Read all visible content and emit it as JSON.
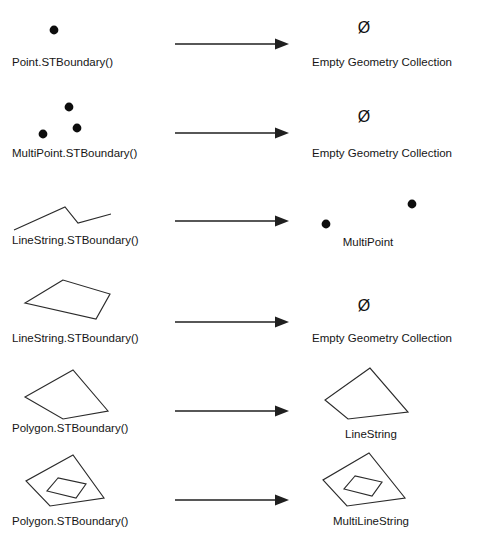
{
  "figure": {
    "background_color": "#ffffff",
    "stroke_color": "#2b2b2b",
    "arrow_color": "#1f1f1f",
    "dot_color": "#0d0d0d",
    "empty_symbol": "Ø",
    "footer_note": ""
  },
  "rows": [
    {
      "id": "point",
      "input_label": "Point.STBoundary()",
      "input_type": "point",
      "output_label": "Empty Geometry Collection",
      "output_type": "empty",
      "output_symbol": "Ø",
      "arrow": "→"
    },
    {
      "id": "multipoint",
      "input_label": "MultiPoint.STBoundary()",
      "input_type": "multipoint",
      "output_label": "Empty Geometry Collection",
      "output_type": "empty",
      "output_symbol": "Ø",
      "arrow": "→"
    },
    {
      "id": "linestring-open",
      "input_label": "LineString.STBoundary()",
      "input_type": "open-linestring",
      "output_label": "MultiPoint",
      "output_type": "multipoint",
      "output_symbol": "",
      "arrow": "→"
    },
    {
      "id": "linestring-closed",
      "input_label": "LineString.STBoundary()",
      "input_type": "closed-linestring",
      "output_label": "Empty Geometry Collection",
      "output_type": "empty",
      "output_symbol": "Ø",
      "arrow": "→"
    },
    {
      "id": "polygon-simple",
      "input_label": "Polygon.STBoundary()",
      "input_type": "polygon",
      "output_label": "LineString",
      "output_type": "ring",
      "output_symbol": "",
      "arrow": "→"
    },
    {
      "id": "polygon-hole",
      "input_label": "Polygon.STBoundary()",
      "input_type": "polygon-with-hole",
      "output_label": "MultiLineString",
      "output_type": "two-rings",
      "output_symbol": "",
      "arrow": "→"
    }
  ]
}
